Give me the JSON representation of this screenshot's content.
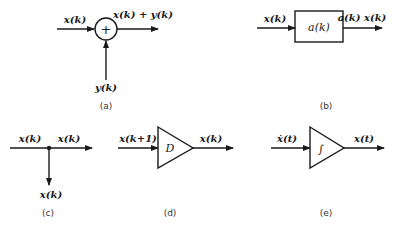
{
  "panels": {
    "a": {
      "caption": "(a)",
      "element": "summing junction",
      "symbol": "+",
      "input_left": "x(k)",
      "input_bottom": "y(k)",
      "output": "x(k) + y(k)"
    },
    "b": {
      "caption": "(b)",
      "element": "gain block",
      "symbol": "a(k)",
      "input": "x(k)",
      "output": "a(k) x(k)"
    },
    "c": {
      "caption": "(c)",
      "element": "branch point",
      "input": "x(k)",
      "output_right": "x(k)",
      "output_down": "x(k)"
    },
    "d": {
      "caption": "(d)",
      "element": "delay",
      "symbol": "D",
      "input": "x(k+1)",
      "output": "x(k)"
    },
    "e": {
      "caption": "(e)",
      "element": "integrator",
      "symbol": "∫",
      "input": "ẋ(t)",
      "output": "x(t)"
    }
  },
  "colors": {
    "line": "#1a1a1a",
    "background": "#ffffff"
  }
}
